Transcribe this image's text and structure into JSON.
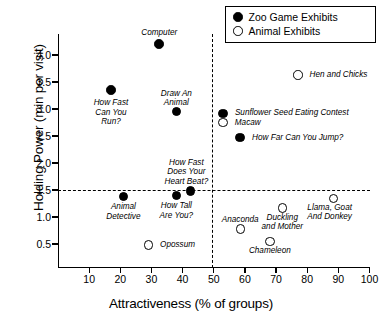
{
  "chart_data": {
    "type": "scatter",
    "title": "",
    "xlabel": "Attractiveness (% of groups)",
    "ylabel": "Holding Power (min per visit)",
    "xlim": [
      0,
      100
    ],
    "ylim": [
      0,
      4.4
    ],
    "xticks": [
      10,
      20,
      30,
      40,
      50,
      60,
      70,
      80,
      90,
      100
    ],
    "yticks": [
      0.5,
      1.0,
      1.5,
      2.0,
      2.5,
      3.0,
      3.5,
      4.0
    ],
    "xtick_labels": [
      "10",
      "20",
      "30",
      "40",
      "50",
      "60",
      "70",
      "80",
      "90",
      "100"
    ],
    "ytick_labels": [
      "0.5",
      "1.0",
      "1.5",
      "2.0",
      "2.5",
      "3.0",
      "3.5",
      "4.0"
    ],
    "grid": false,
    "legend_position": "top-right",
    "reference_lines": [
      {
        "axis": "horizontal",
        "value": 1.5,
        "style": "dashed"
      },
      {
        "axis": "vertical",
        "value": 50,
        "style": "dashed"
      }
    ],
    "series": [
      {
        "name": "Zoo Game Exhibits",
        "marker": "filled-circle",
        "color": "#000000",
        "points": [
          {
            "label": "Computer",
            "x": 32.5,
            "y": 4.2
          },
          {
            "label": "How Fast\nCan You\nRun?",
            "x": 17.0,
            "y": 3.35
          },
          {
            "label": "Draw An\nAnimal",
            "x": 38.0,
            "y": 2.95
          },
          {
            "label": "Sunflower Seed Eating Contest",
            "x": 53.0,
            "y": 2.92
          },
          {
            "label": "How Far Can You Jump?",
            "x": 58.5,
            "y": 2.47
          },
          {
            "label": "How Fast\nDoes Your\nHeart Beat?",
            "x": 42.5,
            "y": 1.48
          },
          {
            "label": "Animal\nDetective",
            "x": 21.0,
            "y": 1.38
          },
          {
            "label": "How Tall\nAre You?",
            "x": 38.0,
            "y": 1.4
          }
        ]
      },
      {
        "name": "Animal Exhibits",
        "marker": "open-circle",
        "color": "#000000",
        "points": [
          {
            "label": "Hen and Chicks",
            "x": 77.0,
            "y": 3.63
          },
          {
            "label": "Macaw",
            "x": 53.0,
            "y": 2.75
          },
          {
            "label": "Llama, Goat\nAnd Donkey",
            "x": 88.5,
            "y": 1.34
          },
          {
            "label": "Duckling\nand Mother",
            "x": 72.0,
            "y": 1.17
          },
          {
            "label": "Anaconda",
            "x": 58.5,
            "y": 0.78
          },
          {
            "label": "Chameleon",
            "x": 68.0,
            "y": 0.55
          },
          {
            "label": "Opossum",
            "x": 29.0,
            "y": 0.48
          }
        ]
      }
    ]
  },
  "legend": {
    "entries": [
      {
        "label": "Zoo Game Exhibits",
        "marker": "filled-circle"
      },
      {
        "label": "Animal Exhibits",
        "marker": "open-circle"
      }
    ]
  },
  "point_labels": {
    "computer": "Computer",
    "how_fast_can_you_run": "How Fast\nCan You\nRun?",
    "draw_an_animal": "Draw An\nAnimal",
    "sunflower": "Sunflower Seed Eating Contest",
    "macaw": "Macaw",
    "how_far_can_you_jump": "How Far Can You Jump?",
    "hen_and_chicks": "Hen and Chicks",
    "how_fast_does_your_heart_beat": "How Fast\nDoes Your\nHeart Beat?",
    "animal_detective": "Animal\nDetective",
    "how_tall_are_you": "How Tall\nAre You?",
    "opossum": "Opossum",
    "anaconda": "Anaconda",
    "duckling_and_mother": "Duckling\nand Mother",
    "chameleon": "Chameleon",
    "llama_goat_and_donkey": "Llama, Goat\nAnd Donkey"
  }
}
